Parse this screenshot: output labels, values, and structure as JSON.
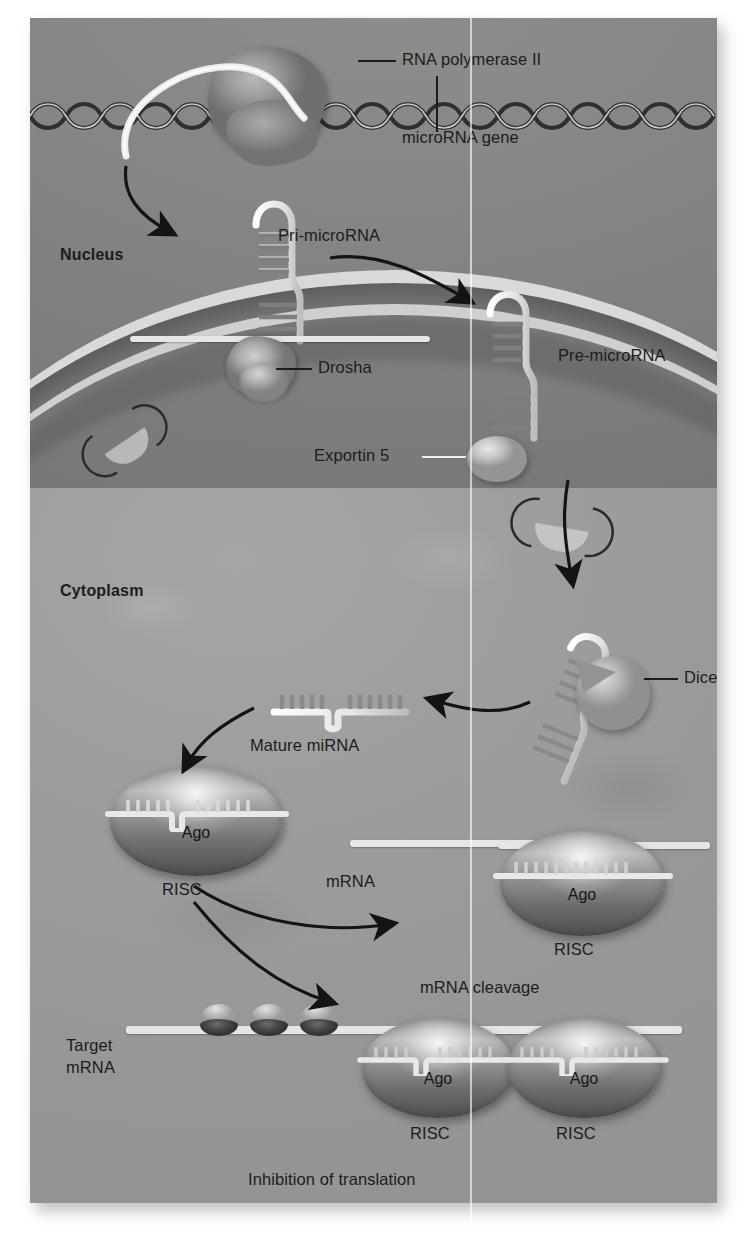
{
  "figure": {
    "compartments": [
      {
        "key": "nucleus",
        "label": "Nucleus"
      },
      {
        "key": "cytoplasm",
        "label": "Cytoplasm"
      }
    ]
  },
  "labels": {
    "rna_polymerase": "RNA polymerase II",
    "microrna_gene": "microRNA gene",
    "pri_microrna": "Pri-microRNA",
    "drosha": "Drosha",
    "pre_microrna": "Pre-microRNA",
    "exportin5": "Exportin 5",
    "nucleus": "Nucleus",
    "cytoplasm": "Cytoplasm",
    "dicer": "Dicer",
    "mature_mirna": "Mature miRNA",
    "risc_1": "RISC",
    "ago_1": "Ago",
    "mrna": "mRNA",
    "ago_cleavage": "Ago",
    "risc_cleavage": "RISC",
    "mrna_cleavage": "mRNA cleavage",
    "target_mrna_line1": "Target",
    "target_mrna_line2": "mRNA",
    "ago_inhib_1": "Ago",
    "risc_inhib_1": "RISC",
    "ago_inhib_2": "Ago",
    "risc_inhib_2": "RISC",
    "inhibition": "Inhibition of translation"
  },
  "colors": {
    "panel_bg": "#9a9a9a",
    "nucleus_bg": "#848484",
    "cytoplasm_bg": "#9d9d9d",
    "rna_white": "#e9e9e9",
    "ink": "#1c1c1c",
    "page_bg": "#ffffff"
  },
  "elements": {
    "dna_helix": "dna-double-helix",
    "nuclear_pores": 2,
    "ribosomes": 3,
    "hairpins": [
      "pri-microRNA-hairpin",
      "pre-microRNA-hairpin",
      "dicer-bound-hairpin"
    ],
    "risc_complexes": 4
  }
}
